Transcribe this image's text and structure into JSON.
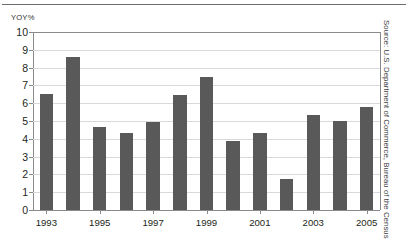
{
  "chart_data": {
    "type": "bar",
    "title": "",
    "subtitle": "",
    "xlabel": "",
    "ylabel": "YOY%",
    "ylim": [
      0,
      10
    ],
    "yticks": [
      0,
      1,
      2,
      3,
      4,
      5,
      6,
      7,
      8,
      9,
      10
    ],
    "ytick_labels": [
      "0",
      "1",
      "2",
      "3",
      "4",
      "5",
      "6",
      "7",
      "8",
      "9",
      "10"
    ],
    "grid": true,
    "legend": "none",
    "bar_color": "#595959",
    "categories": [
      "1993",
      "1994",
      "1995",
      "1996",
      "1997",
      "1998",
      "1999",
      "2000",
      "2001",
      "2002",
      "2003",
      "2004",
      "2005"
    ],
    "xtick_labels": [
      "1993",
      "1995",
      "1997",
      "1999",
      "2001",
      "2003",
      "2005"
    ],
    "values": [
      6.5,
      8.6,
      4.65,
      4.3,
      4.95,
      6.45,
      7.5,
      3.85,
      4.3,
      1.75,
      5.35,
      5.0,
      5.8
    ],
    "annotations": []
  },
  "axis": {
    "unit_caption": "YOY%"
  },
  "source": {
    "text": "Source: U.S. Department of Commerce, Bureau of the Census"
  }
}
